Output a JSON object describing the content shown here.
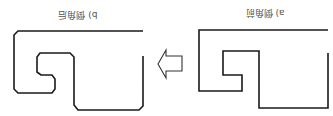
{
  "diagram": {
    "title_cut_off": "",
    "panels": [
      {
        "id": "b",
        "label": "b) 倒角后",
        "meaning": "after chamfering",
        "style": "chamfered corners"
      },
      {
        "id": "a",
        "label": "a) 倒角前",
        "meaning": "before chamfering",
        "style": "sharp corners"
      }
    ],
    "arrow": {
      "direction": "left",
      "from": "a",
      "to": "b"
    },
    "orientation": "rotated 180 degrees",
    "colors": {
      "stroke": "#1a1a1a",
      "arrow_stroke": "#333333",
      "label": "#555555",
      "background": "#ffffff"
    }
  }
}
